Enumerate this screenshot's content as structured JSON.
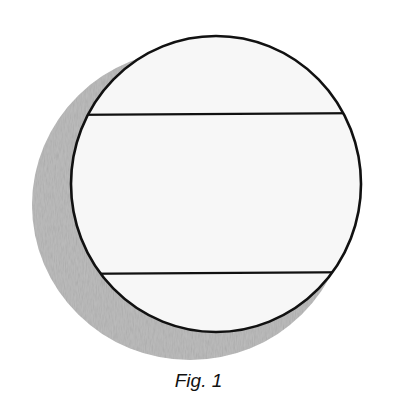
{
  "figure": {
    "caption": "Fig. 1",
    "colors": {
      "outline": "#111111",
      "face": "#f6f6f6",
      "shadow": "#b8b8b8"
    }
  }
}
